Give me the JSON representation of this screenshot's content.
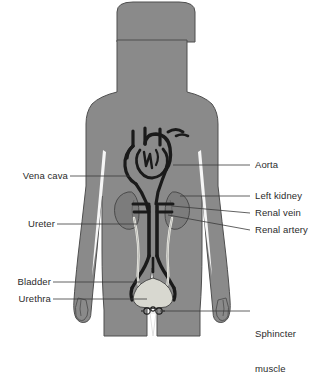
{
  "figure": {
    "background_color": "#ffffff",
    "body_fill": "#8a8a8a",
    "body_outline": "#4f4f4f",
    "vessel_dark": "#1a1a1a",
    "organ_fill": "#7c7c7c",
    "bladder_fill": "#d8d8d0",
    "ureter_color": "#efefe8",
    "label_color": "#2b2b2b",
    "leader_color": "#3a3a3a"
  },
  "labels": {
    "vena_cava": "Vena cava",
    "ureter": "Ureter",
    "bladder": "Bladder",
    "urethra": "Urethra",
    "aorta": "Aorta",
    "left_kidney": "Left kidney",
    "renal_vein": "Renal vein",
    "renal_artery": "Renal artery",
    "sphincter_muscle_line1": "Sphincter",
    "sphincter_muscle_line2": "muscle"
  },
  "structures": [
    {
      "name": "body-silhouette",
      "kind": "figure"
    },
    {
      "name": "heart-great-vessels",
      "kind": "vessel"
    },
    {
      "name": "aorta",
      "kind": "vessel"
    },
    {
      "name": "vena-cava",
      "kind": "vessel"
    },
    {
      "name": "left-kidney",
      "kind": "organ"
    },
    {
      "name": "right-kidney",
      "kind": "organ"
    },
    {
      "name": "renal-vein",
      "kind": "vessel"
    },
    {
      "name": "renal-artery",
      "kind": "vessel"
    },
    {
      "name": "left-ureter",
      "kind": "tube"
    },
    {
      "name": "right-ureter",
      "kind": "tube"
    },
    {
      "name": "bladder",
      "kind": "organ"
    },
    {
      "name": "urethra",
      "kind": "tube"
    },
    {
      "name": "sphincter-muscle",
      "kind": "muscle"
    }
  ]
}
